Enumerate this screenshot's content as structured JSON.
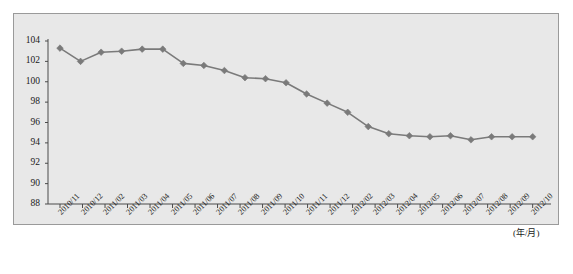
{
  "chart_data": {
    "type": "line",
    "title": "",
    "subtitle": "",
    "xlabel": "(年/月)",
    "ylabel": "",
    "grid": false,
    "legend": null,
    "ylim": [
      88,
      104
    ],
    "yticks": [
      88,
      90,
      92,
      94,
      96,
      98,
      100,
      102,
      104
    ],
    "ytick_labels": [
      "88",
      "90",
      "92",
      "94",
      "96",
      "98",
      "100",
      "102",
      "104"
    ],
    "categories": [
      "2010/11",
      "2010/12",
      "2011/01",
      "2011/02",
      "2011/03",
      "2011/04",
      "2011/05",
      "2011/06",
      "2011/07",
      "2011/08",
      "2011/09",
      "2011/10",
      "2011/11",
      "2011/12",
      "2012/01",
      "2012/02",
      "2012/03",
      "2012/04",
      "2012/05",
      "2012/06",
      "2012/07",
      "2012/08",
      "2012/09",
      "2012/10"
    ],
    "xtick_labels": [
      "2010/11",
      "2010/12",
      "2011/02",
      "2011/03",
      "2011/04",
      "2011/05",
      "2011/06",
      "2011/07",
      "2011/08",
      "2011/09",
      "2011/10",
      "2011/11",
      "2011/12",
      "2012/02",
      "2012/03",
      "2012/04",
      "2012/05",
      "2012/06",
      "2012/07",
      "2012/08",
      "2012/09",
      "2012/10"
    ],
    "values": [
      103.3,
      102.0,
      102.9,
      103.0,
      103.2,
      103.2,
      101.8,
      101.6,
      101.1,
      100.4,
      100.3,
      99.9,
      98.8,
      97.9,
      97.0,
      95.6,
      94.9,
      94.7,
      94.6,
      94.7,
      94.3,
      94.6,
      94.6,
      94.6
    ],
    "series": [
      {
        "name": "",
        "marker": "diamond",
        "color": "#7a7a7a",
        "line_color": "#7a7a7a",
        "values": [
          103.3,
          102.0,
          102.9,
          103.0,
          103.2,
          103.2,
          101.8,
          101.6,
          101.1,
          100.4,
          100.3,
          99.9,
          98.8,
          97.9,
          97.0,
          95.6,
          94.9,
          94.7,
          94.6,
          94.7,
          94.3,
          94.6,
          94.6,
          94.6
        ]
      }
    ],
    "colors": {
      "panel_background": "#e8e8e8",
      "panel_border": "#9a9a9a",
      "axis": "#4a4a4a",
      "series": "#7a7a7a",
      "text": "#1a1a1a"
    }
  }
}
